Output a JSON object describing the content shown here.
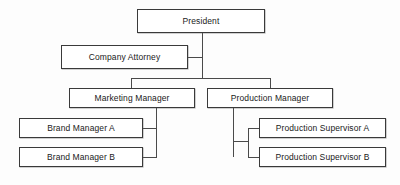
{
  "diagram": {
    "type": "org-chart",
    "background_color": "#fdfdfd",
    "box_border_color": "#3a3a3a",
    "box_fill_color": "#ffffff",
    "connector_color": "#4a4a4a",
    "text_color": "#1a1a1a",
    "nodes": [
      {
        "id": "president",
        "label": "President",
        "level": 0
      },
      {
        "id": "company_attorney",
        "label": "Company Attorney",
        "level": 1
      },
      {
        "id": "marketing_manager",
        "label": "Marketing Manager",
        "level": 2
      },
      {
        "id": "production_manager",
        "label": "Production Manager",
        "level": 2
      },
      {
        "id": "brand_manager_a",
        "label": "Brand Manager A",
        "level": 3
      },
      {
        "id": "brand_manager_b",
        "label": "Brand Manager B",
        "level": 3
      },
      {
        "id": "production_sup_a",
        "label": "Production Supervisor A",
        "level": 3
      },
      {
        "id": "production_sup_b",
        "label": "Production Supervisor B",
        "level": 3
      }
    ],
    "edges": [
      {
        "from": "president",
        "to": "company_attorney",
        "style": "staff"
      },
      {
        "from": "president",
        "to": "marketing_manager",
        "style": "line"
      },
      {
        "from": "president",
        "to": "production_manager",
        "style": "line"
      },
      {
        "from": "marketing_manager",
        "to": "brand_manager_a",
        "style": "line"
      },
      {
        "from": "marketing_manager",
        "to": "brand_manager_b",
        "style": "line"
      },
      {
        "from": "production_manager",
        "to": "production_sup_a",
        "style": "line"
      },
      {
        "from": "production_manager",
        "to": "production_sup_b",
        "style": "line"
      }
    ]
  }
}
